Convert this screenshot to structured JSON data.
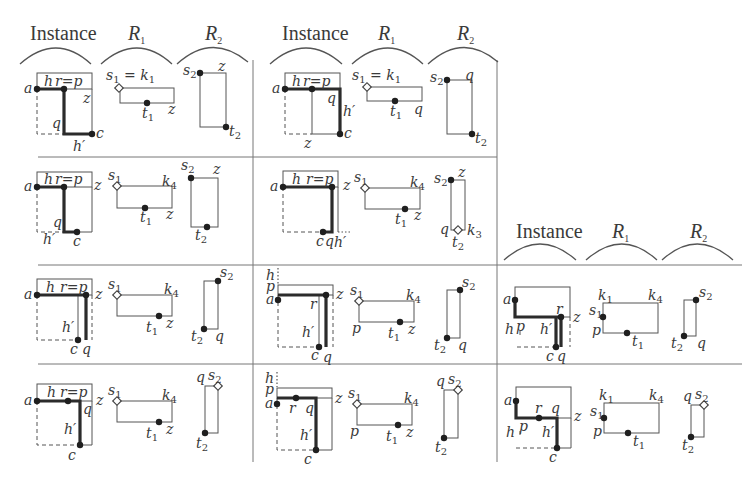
{
  "headers": {
    "instance": "Instance",
    "r1": "R",
    "r1_sub": "1",
    "r2": "R",
    "r2_sub": "2"
  },
  "header_groups": [
    {
      "x": 0,
      "y": 36,
      "arcs_y": 55
    },
    {
      "x": 253,
      "y": 36,
      "arcs_y": 55
    },
    {
      "x": 497,
      "y": 238,
      "arcs_y": 258
    }
  ],
  "grid": {
    "vertical": [
      253,
      497
    ],
    "horizontal_y": [
      157,
      265,
      364
    ],
    "color": "#777777"
  },
  "labels": {
    "a": "a",
    "h": "h",
    "r_eq_p": "r=p",
    "r": "r",
    "p": "p",
    "q": "q",
    "z": "z",
    "c": "c",
    "h_prime": "h′",
    "s": "s",
    "k": "k",
    "t": "t",
    "sub1": "1",
    "sub2": "2",
    "sub3": "3",
    "sub4": "4",
    "s1_eq_k1": "= "
  },
  "cells": [
    {
      "id": "r1c1",
      "row": 1,
      "col": 1,
      "r1_corner": "k1",
      "r1_right_label": "z",
      "r2_top_label": "z"
    },
    {
      "id": "r1c2",
      "row": 1,
      "col": 2,
      "r1_corner": "k1",
      "r1_right_label": "q",
      "r2_top_label": "q"
    },
    {
      "id": "r2c1",
      "row": 2,
      "col": 1,
      "r1_corner": "k4",
      "r1_right_label": "z",
      "r2_top_label": "z"
    },
    {
      "id": "r2c2",
      "row": 2,
      "col": 2,
      "r1_corner": "k4",
      "r1_right_label": "z",
      "r2_top_label": "z",
      "r2_extra": "k3"
    },
    {
      "id": "r3c1",
      "row": 3,
      "col": 1,
      "r1_corner": "k4",
      "r1_right_label": "z",
      "r2_bottom_label": "q"
    },
    {
      "id": "r3c2",
      "row": 3,
      "col": 2,
      "r1_corner": "k4",
      "r1_right_label": "z",
      "r2_bottom_label": "q"
    },
    {
      "id": "r3c3",
      "row": 3,
      "col": 3,
      "r1_corner": "k1,k4",
      "r2_bottom_label": "q"
    },
    {
      "id": "r4c1",
      "row": 4,
      "col": 1,
      "r1_corner": "k4",
      "r1_right_label": "z",
      "r2_top_label": "q"
    },
    {
      "id": "r4c2",
      "row": 4,
      "col": 2,
      "r1_corner": "k4",
      "r1_right_label": "z",
      "r2_top_label": "q"
    },
    {
      "id": "r4c3",
      "row": 4,
      "col": 3,
      "r1_corner": "k1,k4",
      "r2_top_label": "q"
    }
  ]
}
